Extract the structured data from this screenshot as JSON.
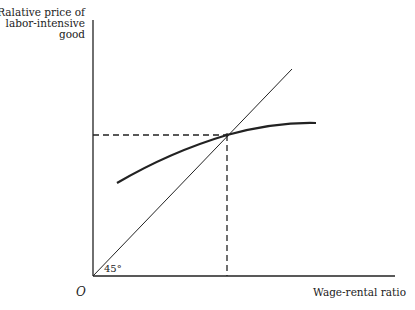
{
  "diagram": {
    "y_axis_label": [
      "Ralative price of",
      "labor-intensive",
      "good"
    ],
    "x_axis_label": "Wage-rental ratio",
    "origin_label": "O",
    "angle_label": "45°",
    "colors": {
      "line": "#222222",
      "background": "#ffffff"
    },
    "elements": {
      "y_axis": {
        "from": [
          93,
          20
        ],
        "to": [
          93,
          276
        ]
      },
      "x_axis": {
        "from": [
          93,
          276
        ],
        "to": [
          395,
          276
        ]
      },
      "line_45_degree": {
        "from": [
          93,
          276
        ],
        "to": [
          292,
          69
        ]
      },
      "curve": {
        "from": [
          117,
          183
        ],
        "via": [
          227,
          135
        ],
        "to": [
          316,
          123
        ]
      },
      "intersection": [
        227,
        135
      ],
      "horizontal_dashed": {
        "from": [
          93,
          135
        ],
        "to": [
          227,
          135
        ]
      },
      "vertical_dashed": {
        "from": [
          227,
          135
        ],
        "to": [
          227,
          276
        ]
      }
    }
  }
}
